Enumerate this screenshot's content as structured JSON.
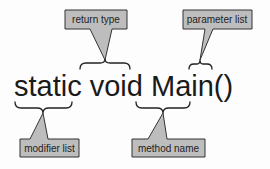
{
  "code_line": {
    "text": "static void Main()",
    "parts": [
      "static",
      "void",
      "Main",
      "()"
    ]
  },
  "callouts": {
    "return_type": {
      "label": "return type",
      "target": "void"
    },
    "parameter_list": {
      "label": "parameter list",
      "target": "()"
    },
    "modifier_list": {
      "label": "modifier list",
      "target": "static"
    },
    "method_name": {
      "label": "method name",
      "target": "Main"
    }
  },
  "colors": {
    "callout_fill": "#bdbdbd",
    "callout_stroke": "#333333",
    "text": "#1a1a1a",
    "background": "#fdfdfd"
  }
}
